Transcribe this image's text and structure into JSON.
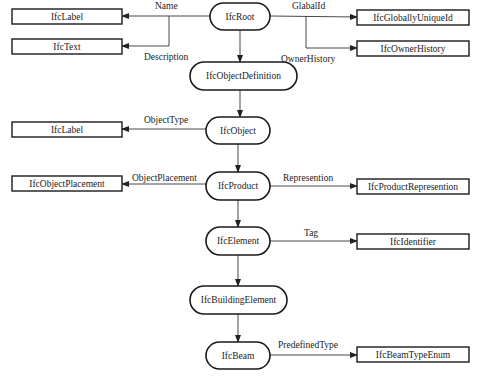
{
  "diagram": {
    "colors": {
      "stroke": "#1a1a1a",
      "text": "#222222",
      "background": "#ffffff"
    },
    "hierarchy": [
      {
        "id": "root",
        "label": "IfcRoot"
      },
      {
        "id": "objdef",
        "label": "IfcObjectDefinition"
      },
      {
        "id": "object",
        "label": "IfcObject"
      },
      {
        "id": "product",
        "label": "IfcProduct"
      },
      {
        "id": "element",
        "label": "IfcElement"
      },
      {
        "id": "building_element",
        "label": "IfcBuildingElement"
      },
      {
        "id": "beam",
        "label": "IfcBeam"
      }
    ],
    "attributes": [
      {
        "id": "name",
        "from": "root",
        "attribute": "Name",
        "type": "IfcLabel",
        "side": "left"
      },
      {
        "id": "description",
        "from": "root",
        "attribute": "Description",
        "type": "IfcText",
        "side": "left"
      },
      {
        "id": "globalid",
        "from": "root",
        "attribute": "GlabalId",
        "type": "IfcGloballyUniqueId",
        "side": "right"
      },
      {
        "id": "ownerhistory",
        "from": "root",
        "attribute": "OwnerHistory",
        "type": "IfcOwnerHistory",
        "side": "right"
      },
      {
        "id": "objecttype",
        "from": "object",
        "attribute": "ObjectType",
        "type": "IfcLabel",
        "side": "left"
      },
      {
        "id": "objectplacement",
        "from": "product",
        "attribute": "ObjectPlacement",
        "type": "IfcObjectPlacement",
        "side": "left"
      },
      {
        "id": "representation",
        "from": "product",
        "attribute": "Represention",
        "type": "IfcProductRepresention",
        "side": "right"
      },
      {
        "id": "tag",
        "from": "element",
        "attribute": "Tag",
        "type": "IfcIdentifier",
        "side": "right"
      },
      {
        "id": "predefinedtype",
        "from": "beam",
        "attribute": "PredefinedType",
        "type": "IfcBeamTypeEnum",
        "side": "right"
      }
    ]
  }
}
